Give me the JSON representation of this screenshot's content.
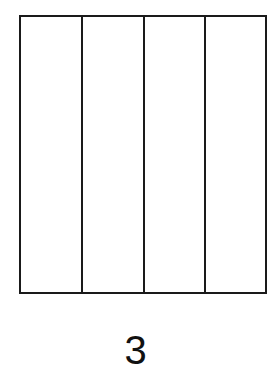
{
  "figure": {
    "shape": "rectangle",
    "parts": 4,
    "orientation": "vertical-strips",
    "shaded_parts": 0,
    "label": "3"
  },
  "colors": {
    "stroke": "#1a1a1a",
    "background": "#ffffff"
  }
}
